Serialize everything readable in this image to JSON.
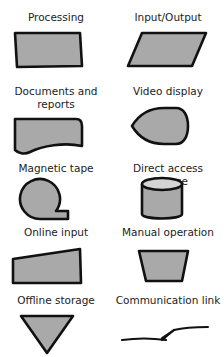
{
  "diagram": {
    "colors": {
      "fill": "#a9a9a9",
      "fill_light": "#d4d4d4",
      "stroke": "#111111",
      "background": "#ffffff"
    },
    "symbols": [
      {
        "id": "processing",
        "label": "Processing",
        "shape": "rectangle"
      },
      {
        "id": "input-output",
        "label": "Input/Output",
        "shape": "parallelogram"
      },
      {
        "id": "documents",
        "label": "Documents and reports",
        "label_lines": [
          "Documents and",
          "reports"
        ],
        "shape": "wavy-bottom-rectangle"
      },
      {
        "id": "video-display",
        "label": "Video display",
        "shape": "display"
      },
      {
        "id": "magnetic-tape",
        "label": "Magnetic tape",
        "shape": "circle-with-tail"
      },
      {
        "id": "direct-access-storage",
        "label": "Direct access storage",
        "shape": "cylinder"
      },
      {
        "id": "online-input",
        "label": "Online input",
        "shape": "slanted-top-rectangle"
      },
      {
        "id": "manual-operation",
        "label": "Manual operation",
        "shape": "trapezoid"
      },
      {
        "id": "offline-storage",
        "label": "Offline storage",
        "shape": "inverted-triangle"
      },
      {
        "id": "communication-link",
        "label": "Communication link",
        "shape": "lightning-line"
      }
    ]
  }
}
